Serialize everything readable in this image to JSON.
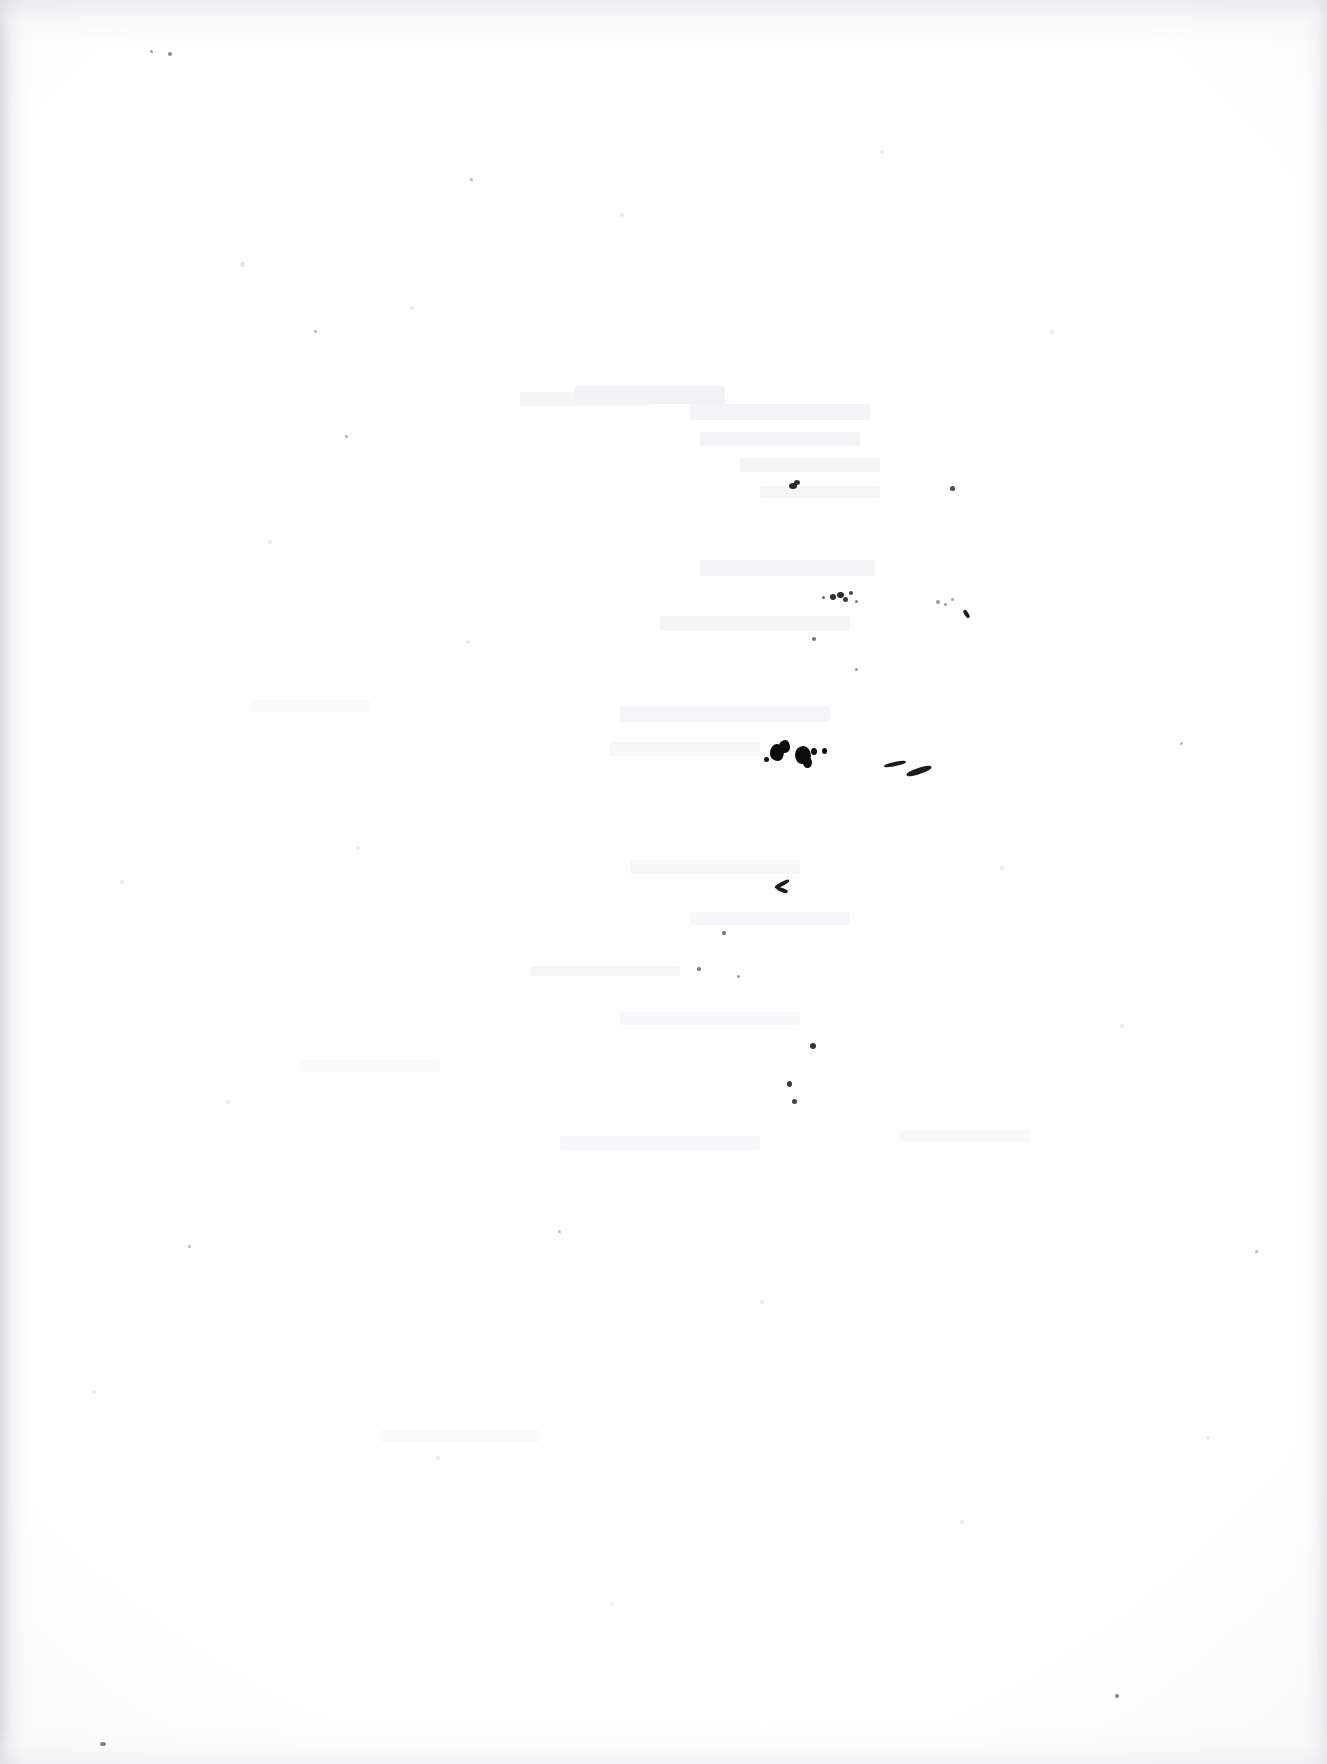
{
  "document": {
    "kind": "scanned-page",
    "content_type": "blank",
    "legible_text": "",
    "page_width": 1327,
    "page_height": 1764,
    "background_color": "#fefefe",
    "paper_tone": "near-white",
    "description": "Scanned blank sheet of paper with scattered ink specks and faint show-through; no printed or handwritten text is legible."
  },
  "colors": {
    "paper": "#fefefe",
    "ink_dark": "#0d0d0f",
    "ink_speck": "#18181a",
    "ink_streak": "#1b1b1e",
    "ghost_gray": "#f2f2f4",
    "edge_shadow": "#cdcdd1"
  },
  "edges": {
    "left": {
      "width": 34,
      "opacity": 0.7
    },
    "top": {
      "height": 44,
      "opacity": 0.62
    },
    "right": {
      "width": 26,
      "opacity": 0.7
    },
    "bottom": {
      "height": 40,
      "opacity": 0.5
    }
  },
  "ghosts": [
    {
      "x": 520,
      "y": 392,
      "w": 130,
      "h": 14,
      "color": "rgba(244,244,246,0.95)"
    },
    {
      "x": 575,
      "y": 386,
      "w": 150,
      "h": 18,
      "color": "rgba(241,241,244,0.95)"
    },
    {
      "x": 690,
      "y": 404,
      "w": 180,
      "h": 16,
      "color": "rgba(243,243,245,0.92)"
    },
    {
      "x": 700,
      "y": 432,
      "w": 160,
      "h": 14,
      "color": "rgba(242,242,245,0.90)"
    },
    {
      "x": 740,
      "y": 458,
      "w": 140,
      "h": 14,
      "color": "rgba(244,244,246,0.90)"
    },
    {
      "x": 760,
      "y": 486,
      "w": 120,
      "h": 12,
      "color": "rgba(245,245,247,0.88)"
    },
    {
      "x": 700,
      "y": 560,
      "w": 175,
      "h": 16,
      "color": "rgba(243,243,245,0.90)"
    },
    {
      "x": 660,
      "y": 616,
      "w": 190,
      "h": 15,
      "color": "rgba(244,244,246,0.88)"
    },
    {
      "x": 620,
      "y": 706,
      "w": 210,
      "h": 16,
      "color": "rgba(245,245,247,0.88)"
    },
    {
      "x": 610,
      "y": 742,
      "w": 150,
      "h": 14,
      "color": "rgba(246,246,248,0.85)"
    },
    {
      "x": 630,
      "y": 860,
      "w": 170,
      "h": 14,
      "color": "rgba(246,246,248,0.85)"
    },
    {
      "x": 690,
      "y": 912,
      "w": 160,
      "h": 13,
      "color": "rgba(246,246,248,0.85)"
    },
    {
      "x": 530,
      "y": 966,
      "w": 150,
      "h": 10,
      "color": "rgba(245,245,247,0.86)"
    },
    {
      "x": 620,
      "y": 1012,
      "w": 180,
      "h": 13,
      "color": "rgba(246,246,248,0.85)"
    },
    {
      "x": 560,
      "y": 1136,
      "w": 200,
      "h": 14,
      "color": "rgba(247,247,249,0.84)"
    },
    {
      "x": 250,
      "y": 700,
      "w": 120,
      "h": 12,
      "color": "rgba(249,249,250,0.80)"
    },
    {
      "x": 300,
      "y": 1060,
      "w": 140,
      "h": 12,
      "color": "rgba(249,249,250,0.80)"
    },
    {
      "x": 380,
      "y": 1430,
      "w": 160,
      "h": 12,
      "color": "rgba(249,249,250,0.80)"
    },
    {
      "x": 900,
      "y": 1130,
      "w": 130,
      "h": 12,
      "color": "rgba(248,248,250,0.82)"
    }
  ],
  "blobs": [
    {
      "x": 770,
      "y": 744,
      "w": 14,
      "h": 17,
      "r": "48% 52% 40% 60% / 55% 45% 58% 42%"
    },
    {
      "x": 779,
      "y": 740,
      "w": 11,
      "h": 13,
      "r": "60% 40% 55% 45% / 45% 60% 40% 55%"
    },
    {
      "x": 795,
      "y": 746,
      "w": 16,
      "h": 18,
      "r": "52% 48% 58% 42% / 48% 55% 45% 52%"
    },
    {
      "x": 803,
      "y": 757,
      "w": 9,
      "h": 11,
      "r": "50%"
    },
    {
      "x": 811,
      "y": 748,
      "w": 6,
      "h": 7,
      "r": "50%"
    },
    {
      "x": 822,
      "y": 748,
      "w": 5,
      "h": 6,
      "r": "50%"
    },
    {
      "x": 764,
      "y": 757,
      "w": 5,
      "h": 5,
      "r": "50%"
    }
  ],
  "streaks": [
    {
      "x": 884,
      "y": 762,
      "w": 22,
      "h": 4,
      "rot": -12
    },
    {
      "x": 906,
      "y": 768,
      "w": 26,
      "h": 6,
      "rot": -18
    },
    {
      "x": 774,
      "y": 882,
      "w": 16,
      "h": 4,
      "rot": -28
    },
    {
      "x": 776,
      "y": 888,
      "w": 12,
      "h": 4,
      "rot": 22
    },
    {
      "x": 962,
      "y": 612,
      "w": 9,
      "h": 4,
      "rot": 58
    }
  ],
  "specks": [
    {
      "x": 789,
      "y": 483,
      "w": 8,
      "h": 6,
      "o": 0.92
    },
    {
      "x": 794,
      "y": 480,
      "w": 6,
      "h": 5,
      "o": 0.88
    },
    {
      "x": 950,
      "y": 486,
      "w": 5,
      "h": 5,
      "o": 0.78
    },
    {
      "x": 830,
      "y": 594,
      "w": 6,
      "h": 6,
      "o": 0.9
    },
    {
      "x": 837,
      "y": 592,
      "w": 7,
      "h": 6,
      "o": 0.92
    },
    {
      "x": 843,
      "y": 597,
      "w": 5,
      "h": 5,
      "o": 0.85
    },
    {
      "x": 849,
      "y": 591,
      "w": 4,
      "h": 4,
      "o": 0.8
    },
    {
      "x": 822,
      "y": 596,
      "w": 3,
      "h": 3,
      "o": 0.65
    },
    {
      "x": 855,
      "y": 600,
      "w": 3,
      "h": 3,
      "o": 0.55
    },
    {
      "x": 936,
      "y": 600,
      "w": 4,
      "h": 4,
      "o": 0.42
    },
    {
      "x": 944,
      "y": 603,
      "w": 3,
      "h": 3,
      "o": 0.4
    },
    {
      "x": 951,
      "y": 598,
      "w": 3,
      "h": 3,
      "o": 0.38
    },
    {
      "x": 812,
      "y": 637,
      "w": 4,
      "h": 4,
      "o": 0.6
    },
    {
      "x": 855,
      "y": 668,
      "w": 3,
      "h": 3,
      "o": 0.45
    },
    {
      "x": 810,
      "y": 1043,
      "w": 6,
      "h": 6,
      "o": 0.88
    },
    {
      "x": 787,
      "y": 1081,
      "w": 5,
      "h": 6,
      "o": 0.85
    },
    {
      "x": 792,
      "y": 1099,
      "w": 5,
      "h": 5,
      "o": 0.82
    },
    {
      "x": 722,
      "y": 931,
      "w": 4,
      "h": 4,
      "o": 0.62
    },
    {
      "x": 697,
      "y": 967,
      "w": 4,
      "h": 4,
      "o": 0.58
    },
    {
      "x": 737,
      "y": 975,
      "w": 3,
      "h": 3,
      "o": 0.42
    },
    {
      "x": 100,
      "y": 1742,
      "w": 6,
      "h": 4,
      "o": 0.8
    },
    {
      "x": 1115,
      "y": 1694,
      "w": 4,
      "h": 4,
      "o": 0.55
    },
    {
      "x": 168,
      "y": 52,
      "w": 4,
      "h": 4,
      "o": 0.5
    },
    {
      "x": 150,
      "y": 50,
      "w": 3,
      "h": 3,
      "o": 0.42
    },
    {
      "x": 345,
      "y": 435,
      "w": 3,
      "h": 3,
      "o": 0.35
    },
    {
      "x": 470,
      "y": 178,
      "w": 3,
      "h": 3,
      "o": 0.32
    },
    {
      "x": 314,
      "y": 330,
      "w": 3,
      "h": 3,
      "o": 0.3
    },
    {
      "x": 1255,
      "y": 1250,
      "w": 3,
      "h": 3,
      "o": 0.32
    },
    {
      "x": 1180,
      "y": 742,
      "w": 3,
      "h": 3,
      "o": 0.3
    },
    {
      "x": 558,
      "y": 1230,
      "w": 3,
      "h": 3,
      "o": 0.28
    },
    {
      "x": 188,
      "y": 1245,
      "w": 3,
      "h": 3,
      "o": 0.3
    }
  ],
  "motes": [
    {
      "x": 240,
      "y": 262,
      "w": 5,
      "h": 5,
      "c": "rgba(205,205,210,0.55)"
    },
    {
      "x": 410,
      "y": 306,
      "w": 4,
      "h": 4,
      "c": "rgba(210,210,215,0.50)"
    },
    {
      "x": 620,
      "y": 213,
      "w": 4,
      "h": 4,
      "c": "rgba(212,212,217,0.48)"
    },
    {
      "x": 880,
      "y": 150,
      "w": 4,
      "h": 4,
      "c": "rgba(214,214,219,0.45)"
    },
    {
      "x": 1050,
      "y": 330,
      "w": 4,
      "h": 4,
      "c": "rgba(214,214,219,0.45)"
    },
    {
      "x": 268,
      "y": 540,
      "w": 4,
      "h": 4,
      "c": "rgba(212,212,217,0.48)"
    },
    {
      "x": 466,
      "y": 640,
      "w": 4,
      "h": 4,
      "c": "rgba(212,212,217,0.46)"
    },
    {
      "x": 356,
      "y": 846,
      "w": 4,
      "h": 4,
      "c": "rgba(214,214,219,0.44)"
    },
    {
      "x": 1000,
      "y": 866,
      "w": 4,
      "h": 4,
      "c": "rgba(214,214,219,0.44)"
    },
    {
      "x": 1120,
      "y": 1024,
      "w": 4,
      "h": 4,
      "c": "rgba(214,214,219,0.42)"
    },
    {
      "x": 226,
      "y": 1100,
      "w": 4,
      "h": 4,
      "c": "rgba(214,214,219,0.44)"
    },
    {
      "x": 760,
      "y": 1300,
      "w": 4,
      "h": 4,
      "c": "rgba(216,216,220,0.42)"
    },
    {
      "x": 436,
      "y": 1456,
      "w": 4,
      "h": 4,
      "c": "rgba(216,216,220,0.42)"
    },
    {
      "x": 960,
      "y": 1520,
      "w": 4,
      "h": 4,
      "c": "rgba(216,216,220,0.40)"
    },
    {
      "x": 610,
      "y": 1602,
      "w": 4,
      "h": 4,
      "c": "rgba(216,216,220,0.40)"
    },
    {
      "x": 1206,
      "y": 1436,
      "w": 4,
      "h": 4,
      "c": "rgba(216,216,220,0.40)"
    },
    {
      "x": 120,
      "y": 880,
      "w": 4,
      "h": 4,
      "c": "rgba(214,214,219,0.44)"
    },
    {
      "x": 92,
      "y": 1390,
      "w": 4,
      "h": 4,
      "c": "rgba(216,216,220,0.42)"
    }
  ]
}
